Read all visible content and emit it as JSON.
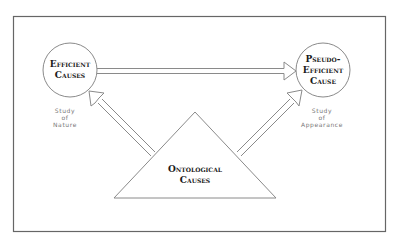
{
  "diagram": {
    "nodes": {
      "efficient": {
        "line1": "Efficient",
        "line2": "Causes"
      },
      "pseudo": {
        "line1": "Pseudo-",
        "line2": "Efficient",
        "line3": "Cause"
      },
      "ontological": {
        "line1": "Ontological",
        "line2": "Causes"
      }
    },
    "notes": {
      "left": {
        "line1": "Study",
        "line2": "of",
        "line3": "Nature"
      },
      "right": {
        "line1": "Study",
        "line2": "of",
        "line3": "Appearance"
      }
    },
    "edges": [
      {
        "from": "efficient",
        "to": "pseudo",
        "style": "double-line-arrow"
      },
      {
        "from": "ontological",
        "to": "efficient",
        "style": "double-line-arrow"
      },
      {
        "from": "ontological",
        "to": "pseudo",
        "style": "double-line-arrow"
      }
    ],
    "colors": {
      "stroke": "#8a8a8a",
      "frame": "#666666",
      "text": "#1a1a1a"
    }
  }
}
